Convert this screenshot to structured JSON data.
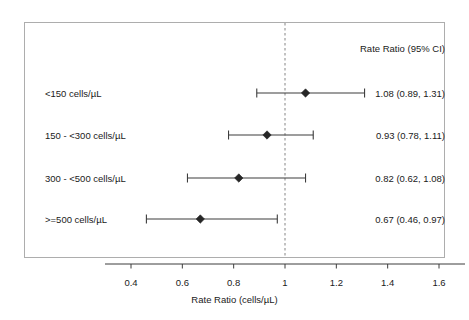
{
  "chart_data": {
    "type": "scatter",
    "subtype": "forest-plot",
    "title": "",
    "xlabel": "Rate Ratio (cells/µL)",
    "ylabel": "",
    "xlim": [
      0.3,
      1.78
    ],
    "xticks": [
      0.4,
      0.6,
      0.8,
      1.0,
      1.2,
      1.4,
      1.6
    ],
    "xticklabels": [
      "0.4",
      "0.6",
      "0.8",
      "1",
      "1.2",
      "1.4",
      "1.6"
    ],
    "grid": false,
    "legend": "none",
    "reference_line": {
      "value": 1.0,
      "style": "dashed",
      "color": "#9a9a9a"
    },
    "column_header": "Rate Ratio (95% CI)",
    "categories": [
      "<150 cells/µL",
      "150 - <300 cells/µL",
      "300 - <500 cells/µL",
      ">=500 cells/µL"
    ],
    "estimates": [
      1.08,
      0.93,
      0.82,
      0.67
    ],
    "ci_lower": [
      0.89,
      0.78,
      0.62,
      0.46
    ],
    "ci_upper": [
      1.31,
      1.11,
      1.08,
      0.97
    ],
    "estimate_labels": [
      "1.08 (0.89, 1.31)",
      "0.93 (0.78, 1.11)",
      "0.82 (0.62, 1.08)",
      "0.67 (0.46, 0.97)"
    ],
    "marker": "diamond",
    "marker_color": "#262626",
    "line_color": "#3d3d3d",
    "frame_color": "#adadad",
    "background_color": "#ffffff"
  },
  "rows": [
    {
      "label": "<150 cells/µL",
      "estimate_label": "1.08 (0.89, 1.31)",
      "estimate": 1.08,
      "lower": 0.89,
      "upper": 1.31
    },
    {
      "label": "150 - <300 cells/µL",
      "estimate_label": "0.93 (0.78, 1.11)",
      "estimate": 0.93,
      "lower": 0.78,
      "upper": 1.11
    },
    {
      "label": "300 - <500 cells/µL",
      "estimate_label": "0.82 (0.62, 1.08)",
      "estimate": 0.82,
      "lower": 0.62,
      "upper": 1.08
    },
    {
      "label": ">=500 cells/µL",
      "estimate_label": "0.67 (0.46, 0.97)",
      "estimate": 0.67,
      "lower": 0.46,
      "upper": 0.97
    }
  ],
  "axis": {
    "title": "Rate Ratio (cells/µL)",
    "ticks": [
      "0.4",
      "0.6",
      "0.8",
      "1",
      "1.2",
      "1.4",
      "1.6"
    ]
  },
  "header": {
    "column_title": "Rate Ratio (95% CI)"
  }
}
